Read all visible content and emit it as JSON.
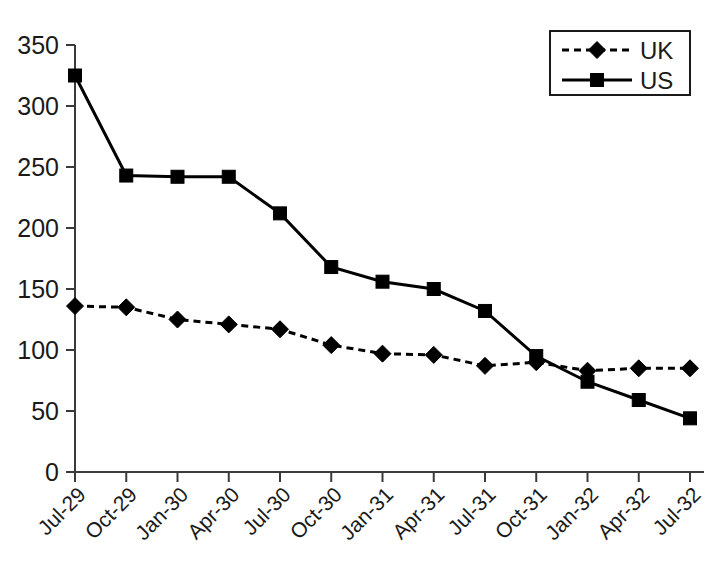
{
  "chart_data": {
    "type": "line",
    "title": "",
    "xlabel": "",
    "ylabel": "",
    "ylim": [
      0,
      350
    ],
    "ytick_values": [
      0,
      50,
      100,
      150,
      200,
      250,
      300,
      350
    ],
    "ytick_labels": [
      "0",
      "50",
      "100",
      "150",
      "200",
      "250",
      "300",
      "350"
    ],
    "grid": false,
    "legend_position": "top-right",
    "categories": [
      "Jul-29",
      "Oct-29",
      "Jan-30",
      "Apr-30",
      "Jul-30",
      "Oct-30",
      "Jan-31",
      "Apr-31",
      "Jul-31",
      "Oct-31",
      "Jan-32",
      "Apr-32",
      "Jul-32"
    ],
    "series": [
      {
        "name": "UK",
        "marker": "diamond",
        "linestyle": "dashed",
        "color": "#000000",
        "values": [
          136,
          135,
          125,
          121,
          117,
          104,
          97,
          96,
          87,
          90,
          83,
          85,
          85
        ]
      },
      {
        "name": "US",
        "marker": "square",
        "linestyle": "solid",
        "color": "#000000",
        "values": [
          325,
          243,
          242,
          242,
          212,
          168,
          156,
          150,
          132,
          95,
          74,
          59,
          44
        ]
      }
    ]
  },
  "legend": {
    "entries": [
      {
        "label": "UK"
      },
      {
        "label": "US"
      }
    ]
  },
  "colors": {
    "axis": "#3a3a3a",
    "line": "#000000",
    "background": "#ffffff"
  }
}
